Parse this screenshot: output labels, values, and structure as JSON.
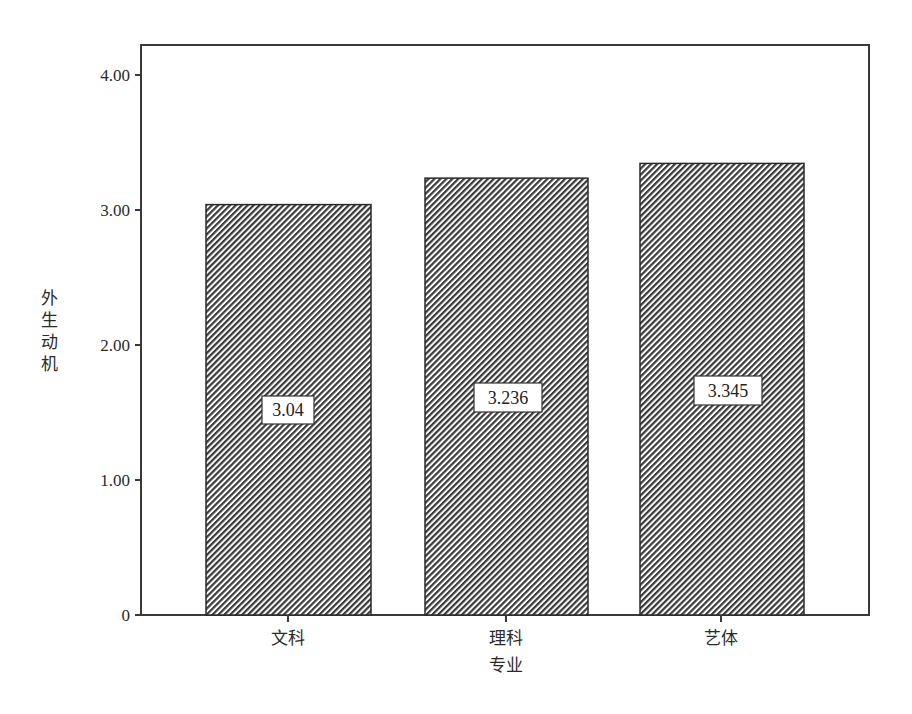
{
  "chart_data": {
    "type": "bar",
    "title": "",
    "categories": [
      "文科",
      "理科",
      "艺体"
    ],
    "values": [
      3.04,
      3.236,
      3.345
    ],
    "value_labels": [
      "3.04",
      "3.236",
      "3.345"
    ],
    "xlabel": "专业",
    "ylabel": "外生动机",
    "ylim": [
      0,
      4.2
    ],
    "yticks": [
      0,
      1.0,
      2.0,
      3.0,
      4.0
    ],
    "ytick_labels": [
      "0",
      "1.00",
      "2.00",
      "3.00",
      "4.00"
    ],
    "grid": false,
    "legend": null,
    "bar_fill": "diagonal-hatch",
    "colors": {
      "bar_stroke": "#2a2a2a",
      "hatch": "#3a3a3a",
      "frame": "#3a3a3a",
      "background": "#ffffff"
    }
  },
  "ylabel_chars": [
    "外",
    "生",
    "动",
    "机"
  ]
}
